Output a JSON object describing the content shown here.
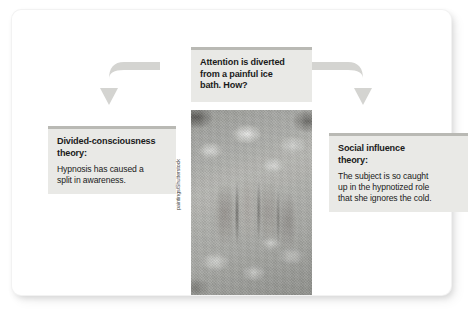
{
  "figure": {
    "background_color": "#ffffff",
    "card_color": "#ffffff",
    "box_fill_color": "#e9e9e6",
    "box_top_bar_color": "#b9b9b4",
    "arrow_color": "#d3d3d0",
    "text_color": "#1a1a1a"
  },
  "question_box": {
    "heading": "Attention is diverted\nfrom a painful ice\nbath. How?"
  },
  "left_box": {
    "heading": "Divided-consciousness\ntheory:",
    "body": "Hypnosis has caused a\nsplit in awareness."
  },
  "right_box": {
    "heading": "Social influence\ntheory:",
    "body": "The subject is so caught\nup in the hypnotized role\nthat she ignores the cold."
  },
  "photo": {
    "description": "hand submerged in a bath of ice cubes",
    "credit": "paintings/Shutterstock"
  },
  "arrows": [
    {
      "name": "arrow-left",
      "direction": "curves left then down"
    },
    {
      "name": "arrow-right",
      "direction": "curves right then down"
    }
  ]
}
